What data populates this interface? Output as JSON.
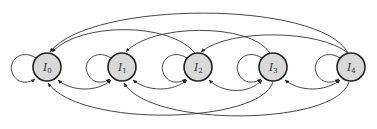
{
  "diagram": {
    "type": "state-transition-graph",
    "nodes": [
      {
        "id": "I0",
        "label": "I",
        "subscript": "0",
        "cx": 47,
        "cy": 67
      },
      {
        "id": "I1",
        "label": "I",
        "subscript": "1",
        "cx": 122,
        "cy": 67
      },
      {
        "id": "I2",
        "label": "I",
        "subscript": "2",
        "cx": 198,
        "cy": 67
      },
      {
        "id": "I3",
        "label": "I",
        "subscript": "3",
        "cx": 273,
        "cy": 67
      },
      {
        "id": "I4",
        "label": "I",
        "subscript": "4",
        "cx": 351,
        "cy": 67
      }
    ],
    "edges": [
      {
        "from": "I0",
        "to": "I0",
        "kind": "self-loop"
      },
      {
        "from": "I1",
        "to": "I1",
        "kind": "self-loop"
      },
      {
        "from": "I2",
        "to": "I2",
        "kind": "self-loop"
      },
      {
        "from": "I3",
        "to": "I3",
        "kind": "self-loop"
      },
      {
        "from": "I4",
        "to": "I4",
        "kind": "self-loop"
      },
      {
        "from": "I1",
        "to": "I0",
        "kind": "bottom-arc"
      },
      {
        "from": "I0",
        "to": "I1",
        "kind": "bottom-arc"
      },
      {
        "from": "I2",
        "to": "I1",
        "kind": "bottom-arc"
      },
      {
        "from": "I1",
        "to": "I2",
        "kind": "bottom-arc"
      },
      {
        "from": "I3",
        "to": "I2",
        "kind": "bottom-arc"
      },
      {
        "from": "I2",
        "to": "I3",
        "kind": "bottom-arc"
      },
      {
        "from": "I4",
        "to": "I3",
        "kind": "bottom-arc"
      },
      {
        "from": "I3",
        "to": "I4",
        "kind": "bottom-arc"
      },
      {
        "from": "I2",
        "to": "I0",
        "kind": "top-arc"
      },
      {
        "from": "I3",
        "to": "I1",
        "kind": "top-arc"
      },
      {
        "from": "I4",
        "to": "I2",
        "kind": "top-arc"
      },
      {
        "from": "I4",
        "to": "I0",
        "kind": "top-arc"
      },
      {
        "from": "I3",
        "to": "I0",
        "kind": "bottom-long-arc"
      },
      {
        "from": "I4",
        "to": "I1",
        "kind": "bottom-long-arc"
      }
    ],
    "colors": {
      "node_fill": "#d9d9d9",
      "node_stroke": "#222222",
      "edge": "#333333"
    }
  }
}
